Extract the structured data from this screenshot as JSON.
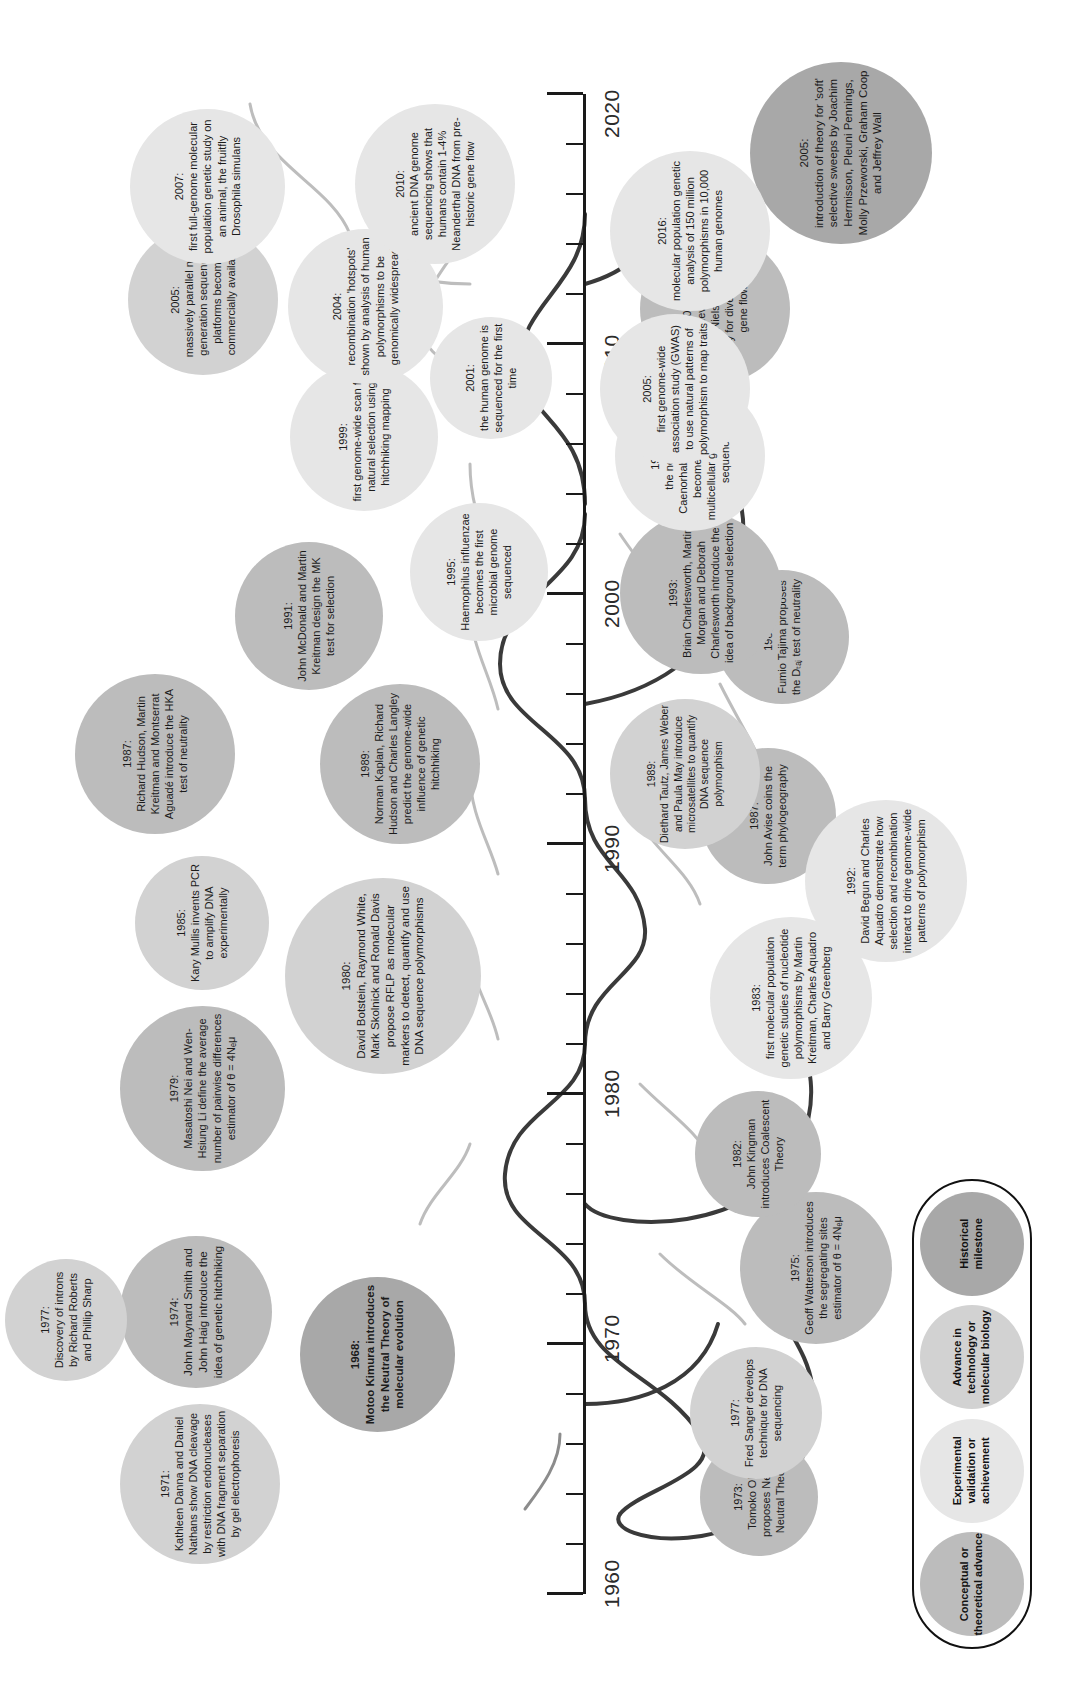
{
  "figure": {
    "orientation": "page rotated 90 degrees"
  },
  "axis": {
    "label_start": "1960",
    "label_end": "2020",
    "decade_labels": [
      "1960",
      "1970",
      "1980",
      "1990",
      "2000",
      "2010",
      "2020"
    ],
    "minor_tick_interval_years": 2,
    "range": [
      1960,
      2020
    ]
  },
  "legend": {
    "items": [
      {
        "label": "Conceptual or theoretical advance",
        "color": "#bcbcbc",
        "key": "conceptual"
      },
      {
        "label": "Experimental validation or achievement",
        "color": "#e6e6e6",
        "key": "experimental"
      },
      {
        "label": "Advance in technology or molecular biology",
        "color": "#d2d2d2",
        "key": "technology"
      },
      {
        "label": "Historical milestone",
        "color": "#a8a8a8",
        "key": "historical"
      }
    ]
  },
  "events": [
    {
      "id": "e1968",
      "year": "1968:",
      "text": "Motoo Kimura introduces the Neutral Theory of molecular evolution",
      "category": "historical",
      "bold": true
    },
    {
      "id": "e1971",
      "year": "1971:",
      "text": "Kathleen Danna and Daniel Nathans show DNA cleavage by restriction endonucleases with DNA fragment separation by gel electrophoresis",
      "category": "technology",
      "bold": false
    },
    {
      "id": "e1973",
      "year": "1973:",
      "text": "Tomoko Ohta proposes Nearly Neutral Theory",
      "category": "conceptual",
      "bold": false
    },
    {
      "id": "e1974",
      "year": "1974:",
      "text": "John Maynard Smith and John Haig introduce the idea of genetic hitchhiking",
      "category": "conceptual",
      "bold": false
    },
    {
      "id": "e1975",
      "year": "1975:",
      "text": "Geoff Watterson introduces the segregating sites estimator of θ = 4Nₑμ",
      "category": "conceptual",
      "bold": false
    },
    {
      "id": "e1977a",
      "year": "1977:",
      "text": "Discovery of introns by Richard Roberts and Phillip Sharp",
      "category": "technology",
      "bold": false
    },
    {
      "id": "e1977b",
      "year": "1977:",
      "text": "Fred Sanger develops technique for DNA sequencing",
      "category": "technology",
      "bold": false
    },
    {
      "id": "e1979",
      "year": "1979:",
      "text": "Masatoshi Nei and Wen-Hsiung Li define the average number of pairwise differences estimator of θ = 4Nₑμ",
      "category": "conceptual",
      "bold": false
    },
    {
      "id": "e1980",
      "year": "1980:",
      "text": "David Botstein, Raymond White, Mark Skolnick and Ronald Davis propose RFLP as molecular markers to detect, quantify and use DNA sequence polymorphisms",
      "category": "technology",
      "bold": false
    },
    {
      "id": "e1982",
      "year": "1982:",
      "text": "John Kingman introduces Coalescent Theory",
      "category": "conceptual",
      "bold": false
    },
    {
      "id": "e1983",
      "year": "1983:",
      "text": "first molecular population genetic studies of nucleotide polymorphisms by Martin Kreitman, Charles Aquadro and Barry Greenberg",
      "category": "experimental",
      "bold": false
    },
    {
      "id": "e1985",
      "year": "1985:",
      "text": "Kary Mullis invents PCR to amplify DNA experimentally",
      "category": "technology",
      "bold": false
    },
    {
      "id": "e1987a",
      "year": "1987:",
      "text": "Richard Hudson, Martin Kreitman and Montserrat Aguadé introduce the HKA test of neutrality",
      "category": "conceptual",
      "bold": false
    },
    {
      "id": "e1987b",
      "year": "1987:",
      "text": "John Avise coins the term phylogeography",
      "category": "conceptual",
      "bold": false
    },
    {
      "id": "e1989a",
      "year": "1989:",
      "text": "Norman Kaplan, Richard Hudson and Charles Langley predict the genome-wide influence of genetic hitchhiking",
      "category": "conceptual",
      "bold": false
    },
    {
      "id": "e1989b",
      "year": "1989:",
      "text": "Diethard Tautz, James Weber and Paula May introduce microsatellites to quantify DNA sequence polymorphism",
      "category": "technology",
      "bold": false
    },
    {
      "id": "e1989c",
      "year": "1989:",
      "text": "Fumio Tajima proposes the Dₜₐⱼ test of neutrality",
      "category": "conceptual",
      "bold": false
    },
    {
      "id": "e1991",
      "year": "1991:",
      "text": "John McDonald and Martin Kreitman design the MK test for selection",
      "category": "conceptual",
      "bold": false
    },
    {
      "id": "e1992",
      "year": "1992:",
      "text": "David Begun and Charles Aquadro demonstrate how selection and recombination interact to drive genome-wide patterns of polymorphism",
      "category": "experimental",
      "bold": false
    },
    {
      "id": "e1993",
      "year": "1993:",
      "text": "Brian Charlesworth, Martin Morgan and Deborah Charlesworth introduce the idea of background selection",
      "category": "conceptual",
      "bold": false
    },
    {
      "id": "e1995",
      "year": "1995:",
      "text": "Haemophilus influenzae becomes the first microbial genome sequenced",
      "category": "experimental",
      "bold": false,
      "italic_words": [
        "Haemophilus",
        "influenzae"
      ]
    },
    {
      "id": "e1998",
      "year": "1998:",
      "text": "the nematode Caenorhabditis elegans becomes the first multicellular genome to be sequenced",
      "category": "experimental",
      "bold": false,
      "italic_words": [
        "Caenorhabditis",
        "elegans"
      ]
    },
    {
      "id": "e1999",
      "year": "1999:",
      "text": "first genome-wide scan for natural selection using hitchhiking mapping",
      "category": "experimental",
      "bold": false
    },
    {
      "id": "e2001a",
      "year": "2001:",
      "text": "the human genome is sequenced for the first time",
      "category": "experimental",
      "bold": false
    },
    {
      "id": "e2001b",
      "year": "2001:",
      "text": "theory developed by Rasmus Nielsen and John Wakeley for divergence with gene flow",
      "category": "conceptual",
      "bold": false
    },
    {
      "id": "e2004",
      "year": "2004:",
      "text": "recombination 'hotspots' shown by analysis of human polymorphisms to be genomically widespread",
      "category": "experimental",
      "bold": false
    },
    {
      "id": "e2005a",
      "year": "2005:",
      "text": "massively parallel next-generation sequencing platforms become commercially available",
      "category": "technology",
      "bold": false
    },
    {
      "id": "e2005b",
      "year": "2005:",
      "text": "first genome-wide association study (GWAS) to use natural patterns of polymorphism to map traits",
      "category": "experimental",
      "bold": false
    },
    {
      "id": "e2005c",
      "year": "2005:",
      "text": "introduction of theory for 'soft' selective sweeps by Joachim Hermisson, Pleuni Pennings, Molly Przeworski, Graham Coop and Jeffrey Wall",
      "category": "conceptual",
      "bold": false
    },
    {
      "id": "e2007",
      "year": "2007:",
      "text": "first full-genome molecular population genetic study on an animal, the fruitfly Drosophila simulans",
      "category": "experimental",
      "bold": false,
      "italic_words": [
        "Drosophila",
        "simulans"
      ]
    },
    {
      "id": "e2010",
      "year": "2010:",
      "text": "ancient DNA genome sequencing shows that humans contain 1-4% Neanderthal DNA from pre-historic gene flow",
      "category": "experimental",
      "bold": false
    },
    {
      "id": "e2016",
      "year": "2016:",
      "text": "molecular population genetic analysis of 150 million polymorphisms in 10,000 human genomes",
      "category": "experimental",
      "bold": false
    }
  ],
  "colors": {
    "historical": "#a8a8a8",
    "technology": "#d2d2d2",
    "experimental": "#e6e6e6",
    "conceptual": "#bcbcbc",
    "axis": "#1a1a1a",
    "background": "#ffffff"
  }
}
